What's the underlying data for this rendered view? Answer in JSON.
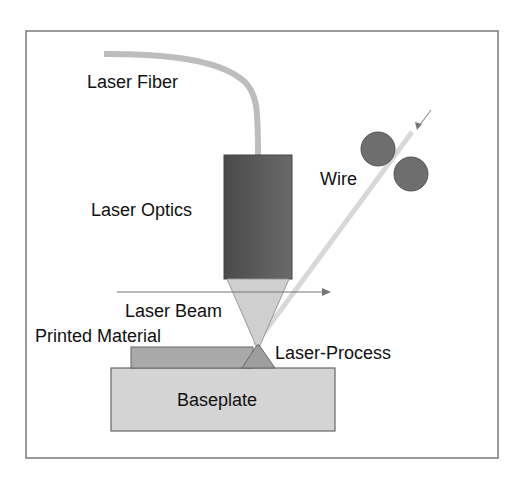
{
  "diagram": {
    "labels": {
      "laser_fiber": "Laser Fiber",
      "laser_optics": "Laser Optics",
      "wire": "Wire",
      "laser_beam": "Laser Beam",
      "printed_material": "Printed Material",
      "laser_process": "Laser-Process",
      "baseplate": "Baseplate"
    },
    "colors": {
      "frame": "#7a7a7a",
      "fiber": "#bdbdbd",
      "optics": "#5c5c5c",
      "beam": "#cfcfcf",
      "wire": "#d8d8d8",
      "rollers": "#6e6e6e",
      "printed_material": "#a9a9a9",
      "process_zone": "#9e9e9e",
      "baseplate": "#d4d4d4",
      "arrow": "#777777"
    }
  }
}
